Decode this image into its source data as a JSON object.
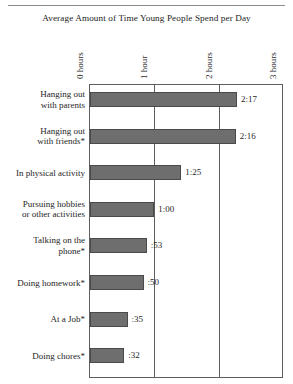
{
  "chart_data": {
    "type": "bar",
    "orientation": "horizontal",
    "title": "Average Amount of Time Young People Spend per Day",
    "xlabel": "",
    "ylabel": "",
    "xlim": [
      0,
      3
    ],
    "grid": true,
    "legend": null,
    "axis_tick_labels": [
      "0 hours",
      "1 hour",
      "2 hours",
      "3 hours"
    ],
    "axis_tick_values": [
      0,
      1,
      2,
      3
    ],
    "categories": [
      "Hanging out with parents",
      "Hanging out with friends*",
      "In physical activity",
      "Pursuing hobbies or other activities",
      "Talking on the phone*",
      "Doing homework*",
      "At a Job*",
      "Doing chores*"
    ],
    "value_labels": [
      "2:17",
      "2:16",
      "1:25",
      "1:00",
      ":53",
      ":50",
      ":35",
      ":32"
    ],
    "values": [
      2.2833,
      2.2667,
      1.4167,
      1.0,
      0.8833,
      0.8333,
      0.5833,
      0.5333
    ],
    "colors": {
      "bar_fill": "#6e6e6e",
      "bar_stroke": "#4a4a4a",
      "frame": "#5d5d5d",
      "text": "#262626",
      "background": "#ffffff"
    }
  },
  "rows": [
    {
      "label_line1": "Hanging out",
      "label_line2": "with parents",
      "value_label": "2:17",
      "value": 2.2833,
      "lines": 2
    },
    {
      "label_line1": "Hanging out",
      "label_line2": "with friends*",
      "value_label": "2:16",
      "value": 2.2667,
      "lines": 2
    },
    {
      "label_line1": "In physical activity",
      "label_line2": "",
      "value_label": "1:25",
      "value": 1.4167,
      "lines": 1
    },
    {
      "label_line1": "Pursuing hobbies",
      "label_line2": "or other activities",
      "value_label": "1:00",
      "value": 1.0,
      "lines": 2
    },
    {
      "label_line1": "Talking on the",
      "label_line2": "phone*",
      "value_label": ":53",
      "value": 0.8833,
      "lines": 2
    },
    {
      "label_line1": "Doing homework*",
      "label_line2": "",
      "value_label": ":50",
      "value": 0.8333,
      "lines": 1
    },
    {
      "label_line1": "At a Job*",
      "label_line2": "",
      "value_label": ":35",
      "value": 0.5833,
      "lines": 1
    },
    {
      "label_line1": "Doing chores*",
      "label_line2": "",
      "value_label": ":32",
      "value": 0.5333,
      "lines": 1
    }
  ],
  "axis": {
    "ticks": [
      {
        "label": "0 hours",
        "value": 0
      },
      {
        "label": "1 hour",
        "value": 1
      },
      {
        "label": "2 hours",
        "value": 2
      },
      {
        "label": "3 hours",
        "value": 3
      }
    ]
  }
}
